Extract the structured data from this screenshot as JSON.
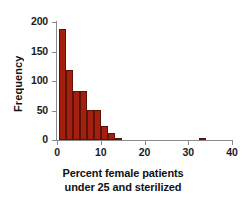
{
  "chart_data": {
    "type": "bar",
    "title": "",
    "subtitle": "",
    "xlabel": "Percent female patients under 25 and sterilized",
    "xlabel_line1": "Percent female patients",
    "xlabel_line2": "under 25 and sterilized",
    "ylabel": "Frequency",
    "xlim": [
      0,
      40
    ],
    "ylim": [
      0,
      200
    ],
    "xticks": [
      0,
      10,
      20,
      30,
      40
    ],
    "yticks": [
      0,
      50,
      100,
      150,
      200
    ],
    "xtick_labels": [
      "0",
      "10",
      "20",
      "30",
      "40"
    ],
    "ytick_labels": [
      "0",
      "50",
      "100",
      "150",
      "200"
    ],
    "grid": false,
    "legend": false,
    "bar_color": "#A4200E",
    "bar_edge_color": "#5D1208",
    "axis_color": "#8A8A8A",
    "background_color": "#FFFFFF",
    "bin_width": 1.6,
    "bins": [
      {
        "x_start": 0.4,
        "x_end": 2.0,
        "value": 189
      },
      {
        "x_start": 2.0,
        "x_end": 3.6,
        "value": 118
      },
      {
        "x_start": 3.6,
        "x_end": 5.2,
        "value": 83
      },
      {
        "x_start": 5.2,
        "x_end": 6.8,
        "value": 83
      },
      {
        "x_start": 6.8,
        "x_end": 8.4,
        "value": 51
      },
      {
        "x_start": 8.4,
        "x_end": 10.0,
        "value": 51
      },
      {
        "x_start": 10.0,
        "x_end": 11.6,
        "value": 23
      },
      {
        "x_start": 11.6,
        "x_end": 13.2,
        "value": 12
      },
      {
        "x_start": 13.2,
        "x_end": 14.8,
        "value": 3
      },
      {
        "x_start": 32.4,
        "x_end": 34.0,
        "value": 2
      }
    ],
    "categories": [
      "0.4-2.0",
      "2.0-3.6",
      "3.6-5.2",
      "5.2-6.8",
      "6.8-8.4",
      "8.4-10.0",
      "10.0-11.6",
      "11.6-13.2",
      "13.2-14.8",
      "32.4-34.0"
    ],
    "values": [
      189,
      118,
      83,
      83,
      51,
      51,
      23,
      12,
      3,
      2
    ]
  }
}
